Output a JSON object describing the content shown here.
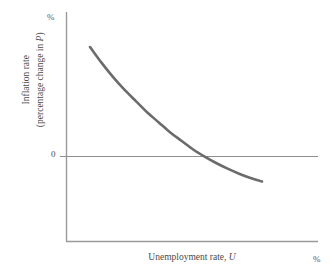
{
  "figure": {
    "background_color": "#ffffff",
    "axis_color": "#8c8c8c",
    "curve_color": "#6b6b6b",
    "text_color": "#4a4a4a"
  },
  "axes": {
    "y_unit_label": "%",
    "x_unit_label": "%",
    "zero_tick_label": "0",
    "y_title_line1": "Inflation rate",
    "y_title_line2_pre": "(percentage change in ",
    "y_title_line2_var": "P",
    "y_title_line2_post": ")",
    "x_title_pre": "Unemployment rate, ",
    "x_title_var": "U"
  },
  "chart_data": {
    "type": "line",
    "title": "",
    "xlabel": "Unemployment rate, U",
    "ylabel": "Inflation rate (percentage change in P)",
    "xlabel_unit": "%",
    "ylabel_unit": "%",
    "grid": false,
    "legend": "none",
    "xlim": [
      0,
      10
    ],
    "ylim": [
      -2,
      10
    ],
    "zero_line": 0,
    "series": [
      {
        "name": "Phillips curve",
        "color": "#6b6b6b",
        "x": [
          2.0,
          2.4,
          2.8,
          3.2,
          3.6,
          4.0,
          4.4,
          4.8,
          5.2,
          5.6,
          6.0,
          6.4,
          6.8,
          7.2,
          7.6,
          8.0
        ],
        "y": [
          8.6,
          7.5,
          6.5,
          5.6,
          4.8,
          4.0,
          3.3,
          2.6,
          2.0,
          1.4,
          0.9,
          0.45,
          0.05,
          -0.3,
          -0.6,
          -0.85
        ]
      }
    ],
    "annotations": [
      {
        "text": "%",
        "position": "y-axis-top"
      },
      {
        "text": "%",
        "position": "x-axis-right"
      },
      {
        "text": "0",
        "position": "y-axis-zero-tick"
      }
    ]
  }
}
